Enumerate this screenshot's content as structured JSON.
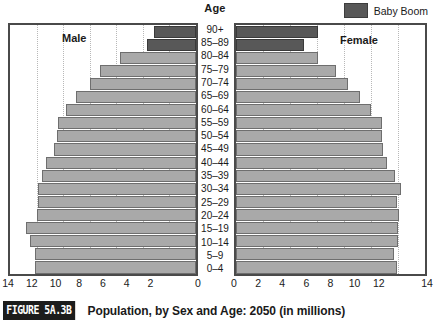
{
  "header": {
    "age_label": "Age"
  },
  "legend": {
    "swatch_name": "baby-boom-swatch",
    "label": "Baby Boom",
    "color": "#585858"
  },
  "panels": {
    "male_label": "Male",
    "female_label": "Female"
  },
  "caption": {
    "figure_tag": "FIGURE 5A.3B",
    "text": "Population, by Sex and Age: 2050 (in millions)"
  },
  "axis": {
    "male_ticks": [
      "14",
      "12",
      "10",
      "8",
      "6",
      "4",
      "2",
      "0"
    ],
    "female_ticks": [
      "0",
      "2",
      "4",
      "6",
      "8",
      "10",
      "12",
      "14"
    ]
  },
  "colors": {
    "bar": "#a9a9a9",
    "bar_border": "#6e6e6e",
    "baby_boom": "#585858",
    "frame": "#4a4a4a",
    "grid": "#b8b8b8"
  },
  "chart_data": {
    "type": "bar",
    "title": "Population, by Sex and Age: 2050 (in millions)",
    "subtitle": "",
    "xlabel": "",
    "ylabel": "Age",
    "orientation": "horizontal",
    "layout": "population-pyramid",
    "xlim": [
      0,
      14
    ],
    "axis_direction": {
      "male": "right-to-left",
      "female": "left-to-right"
    },
    "grid": true,
    "gridlines_at": [
      2,
      4,
      6,
      8,
      10,
      12
    ],
    "legend_position": "top-right",
    "categories": [
      "90+",
      "85-89",
      "80-84",
      "75-79",
      "70-74",
      "65-69",
      "60-64",
      "55-59",
      "50-54",
      "45-49",
      "40-44",
      "35-39",
      "30-34",
      "25-29",
      "20-24",
      "15-19",
      "10-14",
      "5-9",
      "0-4"
    ],
    "series": [
      {
        "name": "Male",
        "values": [
          3.2,
          3.7,
          5.7,
          7.2,
          8.0,
          9.0,
          9.8,
          10.4,
          10.5,
          10.7,
          11.3,
          11.6,
          11.9,
          11.9,
          12.0,
          12.8,
          12.5,
          12.1,
          12.1
        ]
      },
      {
        "name": "Female",
        "values": [
          6.1,
          5.0,
          6.1,
          7.4,
          8.3,
          9.2,
          10.0,
          10.8,
          10.8,
          10.9,
          11.2,
          11.8,
          12.2,
          11.9,
          12.1,
          12.0,
          12.0,
          11.7,
          11.9
        ]
      }
    ],
    "baby_boom_rows": [
      "90+",
      "85-89"
    ],
    "baby_boom_note": "Dark bars mark the Baby Boom cohort (ages 85-89 and 90+ in 2050)"
  }
}
